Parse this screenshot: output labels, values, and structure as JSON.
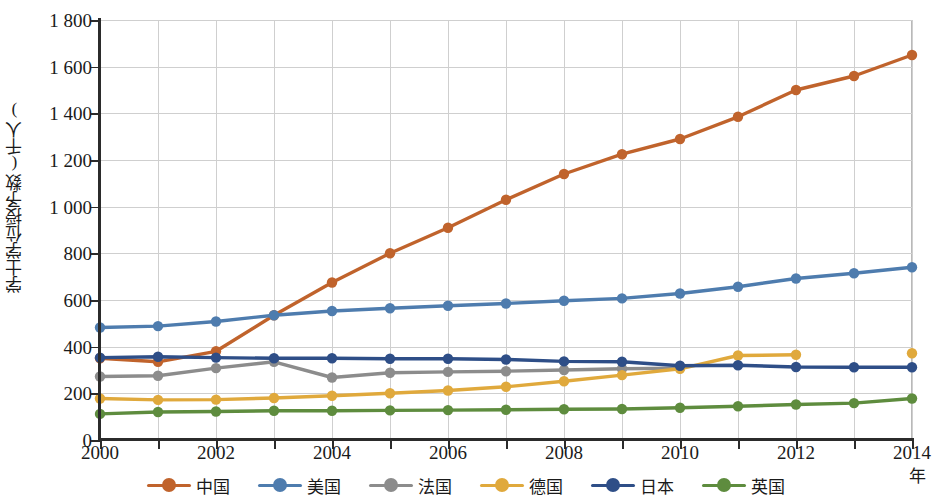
{
  "chart_data": {
    "type": "line",
    "title": "",
    "xlabel": "年",
    "ylabel": "学士学位授予数(千人)",
    "xlim": [
      2000,
      2014
    ],
    "ylim": [
      0,
      1800
    ],
    "ytick_step": 200,
    "grid": true,
    "legend_position": "bottom",
    "x": [
      2000,
      2001,
      2002,
      2003,
      2004,
      2005,
      2006,
      2007,
      2008,
      2009,
      2010,
      2011,
      2012,
      2013,
      2014
    ],
    "xtick_labels": [
      "2000",
      "",
      "2002",
      "",
      "2004",
      "",
      "2006",
      "",
      "2008",
      "",
      "2010",
      "",
      "2012",
      "",
      "2014"
    ],
    "ytick_labels": [
      "0",
      "200",
      "400",
      "600",
      "800",
      "1 000",
      "1 200",
      "1 400",
      "1 600",
      "1 800"
    ],
    "ytick_values": [
      0,
      200,
      400,
      600,
      800,
      1000,
      1200,
      1400,
      1600,
      1800
    ],
    "series": [
      {
        "name": "中国",
        "color": "#C0632C",
        "values": [
          350,
          335,
          380,
          535,
          675,
          800,
          910,
          1030,
          1140,
          1225,
          1290,
          1385,
          1500,
          1560,
          1650
        ]
      },
      {
        "name": "美国",
        "color": "#4E7CAE",
        "values": [
          482,
          488,
          508,
          535,
          553,
          565,
          575,
          585,
          597,
          607,
          628,
          657,
          692,
          715,
          740
        ]
      },
      {
        "name": "法国",
        "color": "#8C8C8C",
        "values": [
          272,
          275,
          308,
          335,
          268,
          288,
          292,
          295,
          300,
          305,
          308,
          null,
          null,
          null,
          null
        ]
      },
      {
        "name": "德国",
        "color": "#E0A93C",
        "values": [
          178,
          172,
          173,
          180,
          190,
          200,
          212,
          228,
          252,
          278,
          305,
          362,
          365,
          null,
          372
        ]
      },
      {
        "name": "日本",
        "color": "#2E4E87",
        "values": [
          353,
          357,
          353,
          350,
          350,
          348,
          348,
          345,
          337,
          335,
          318,
          320,
          313,
          312,
          312
        ]
      },
      {
        "name": "英国",
        "color": "#5E8C3E",
        "values": [
          112,
          120,
          122,
          125,
          125,
          127,
          128,
          130,
          132,
          133,
          138,
          145,
          152,
          158,
          178
        ]
      }
    ]
  },
  "legend": {
    "items": [
      {
        "label": "中国",
        "color": "#C0632C"
      },
      {
        "label": "美国",
        "color": "#4E7CAE"
      },
      {
        "label": "法国",
        "color": "#8C8C8C"
      },
      {
        "label": "德国",
        "color": "#E0A93C"
      },
      {
        "label": "日本",
        "color": "#2E4E87"
      },
      {
        "label": "英国",
        "color": "#5E8C3E"
      }
    ]
  }
}
